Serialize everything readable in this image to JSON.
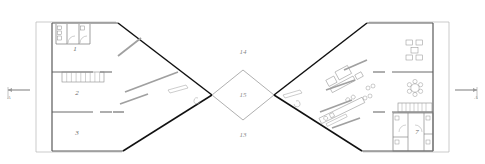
{
  "drawing": {
    "type": "architectural-floor-plan",
    "description": "Symmetric bowtie floor plan with two mirrored wings and a central diamond courtyard",
    "background_color": "#ffffff",
    "wall_color_primary": "#1a1a1a",
    "wall_color_secondary": "#9a9a9a",
    "furniture_color": "#8c8c8c",
    "label_color": "#6b6b6b"
  },
  "rooms": [
    {
      "id": "room-1",
      "label": "1",
      "x": 75,
      "y": 51,
      "note": "service core, upper left"
    },
    {
      "id": "room-2",
      "label": "2",
      "x": 77,
      "y": 93,
      "note": "left wing middle room"
    },
    {
      "id": "room-3",
      "label": "3",
      "x": 77,
      "y": 133,
      "note": "left wing lower room"
    },
    {
      "id": "room-7",
      "label": "7",
      "x": 417,
      "y": 132,
      "note": "right wing sanitary core"
    }
  ],
  "zones": [
    {
      "id": "zone-14",
      "label": "14",
      "x": 243,
      "y": 52,
      "note": "upper open area"
    },
    {
      "id": "zone-15",
      "label": "15",
      "x": 243,
      "y": 95,
      "note": "central diamond courtyard"
    },
    {
      "id": "zone-13",
      "label": "13",
      "x": 243,
      "y": 135,
      "note": "lower open area"
    }
  ],
  "section_markers": [
    {
      "id": "section-marker-left",
      "label": "A",
      "x": 10,
      "y": 93,
      "direction": "right"
    },
    {
      "id": "section-marker-right",
      "label": "A",
      "x": 472,
      "y": 93,
      "direction": "left"
    }
  ],
  "left_wing": {
    "name": "left-wing",
    "outline": "15,22 115,22 160,62 160,122 120,152 15,152",
    "exterior_wall": "15,22 15,152",
    "rooms": [
      "1",
      "2",
      "3"
    ],
    "stair": {
      "id": "stair-left",
      "x": 62,
      "y": 72,
      "width": 40,
      "height": 10,
      "treads": 9
    },
    "partitions": 2
  },
  "right_wing": {
    "name": "right-wing",
    "rooms": [
      "7"
    ],
    "stair": {
      "id": "stair-right",
      "x": 398,
      "y": 108,
      "width": 32,
      "height": 9,
      "treads": 8
    },
    "furniture_groups": [
      {
        "id": "desk-cluster-top",
        "note": "four desks around a center table"
      },
      {
        "id": "round-table-group",
        "note": "round table with six chairs"
      },
      {
        "id": "sofa-group",
        "note": "angled lounge seating"
      },
      {
        "id": "workstation-row",
        "note": "angled linear workstation bank"
      }
    ]
  },
  "courtyard": {
    "name": "central-diamond",
    "points": "212,95 243,70 274,95 243,120"
  }
}
